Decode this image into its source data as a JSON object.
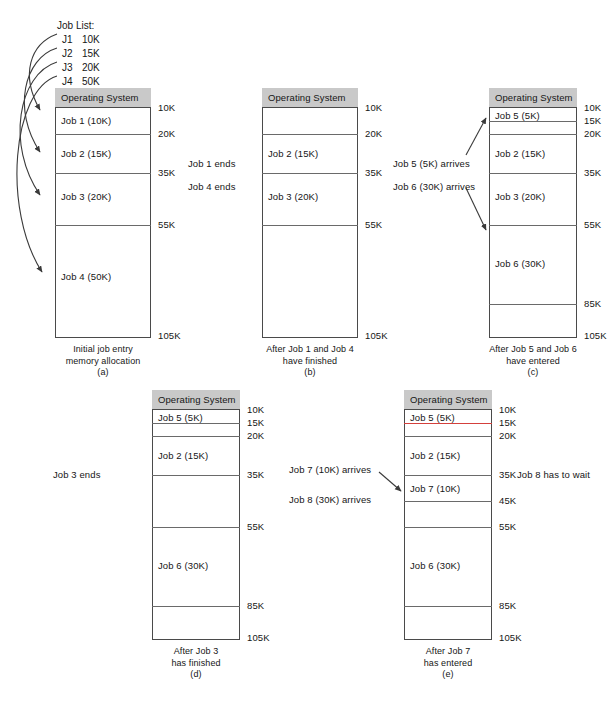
{
  "job_list": {
    "title": "Job List:",
    "rows": [
      {
        "name": "J1",
        "size": "10K"
      },
      {
        "name": "J2",
        "size": "15K"
      },
      {
        "name": "J3",
        "size": "20K"
      },
      {
        "name": "J4",
        "size": "50K"
      }
    ]
  },
  "os_label": "Operating System",
  "columns": [
    {
      "id": "a",
      "caption": "Initial job entry\nmemory allocation\n(a)",
      "blocks": [
        {
          "label": "Job 1   (10K)",
          "from": "10K",
          "to": "20K"
        },
        {
          "label": "Job 2   (15K)",
          "from": "20K",
          "to": "35K"
        },
        {
          "label": "Job 3   (20K)",
          "from": "35K",
          "to": "55K"
        },
        {
          "label": "Job 4   (50K)",
          "from": "55K",
          "to": "105K"
        }
      ],
      "addresses": [
        "10K",
        "20K",
        "35K",
        "55K",
        "105K"
      ]
    },
    {
      "id": "b",
      "caption": "After Job 1 and Job 4\nhave finished\n(b)",
      "blocks": [
        {
          "label": "",
          "from": "10K",
          "to": "20K"
        },
        {
          "label": "Job 2   (15K)",
          "from": "20K",
          "to": "35K"
        },
        {
          "label": "Job 3   (20K)",
          "from": "35K",
          "to": "55K"
        },
        {
          "label": "",
          "from": "55K",
          "to": "105K"
        }
      ],
      "addresses": [
        "10K",
        "20K",
        "35K",
        "55K",
        "105K"
      ]
    },
    {
      "id": "c",
      "caption": "After Job 5 and Job 6\nhave entered\n(c)",
      "blocks": [
        {
          "label": "Job 5   (5K)",
          "from": "10K",
          "to": "15K"
        },
        {
          "label": "",
          "from": "15K",
          "to": "20K"
        },
        {
          "label": "Job 2   (15K)",
          "from": "20K",
          "to": "35K"
        },
        {
          "label": "Job 3   (20K)",
          "from": "35K",
          "to": "55K"
        },
        {
          "label": "Job 6   (30K)",
          "from": "55K",
          "to": "85K"
        },
        {
          "label": "",
          "from": "85K",
          "to": "105K"
        }
      ],
      "addresses": [
        "10K",
        "15K",
        "20K",
        "35K",
        "55K",
        "85K",
        "105K"
      ]
    },
    {
      "id": "d",
      "caption": "After Job 3\nhas finished\n(d)",
      "blocks": [
        {
          "label": "Job 5   (5K)",
          "from": "10K",
          "to": "15K"
        },
        {
          "label": "",
          "from": "15K",
          "to": "20K"
        },
        {
          "label": "Job 2   (15K)",
          "from": "20K",
          "to": "35K"
        },
        {
          "label": "",
          "from": "35K",
          "to": "55K"
        },
        {
          "label": "Job 6   (30K)",
          "from": "55K",
          "to": "85K"
        },
        {
          "label": "",
          "from": "85K",
          "to": "105K"
        }
      ],
      "addresses": [
        "10K",
        "15K",
        "20K",
        "35K",
        "55K",
        "85K",
        "105K"
      ]
    },
    {
      "id": "e",
      "caption": "After Job 7\nhas entered\n(e)",
      "blocks": [
        {
          "label": "Job 5   (5K)",
          "from": "10K",
          "to": "15K"
        },
        {
          "label": "",
          "from": "15K",
          "to": "20K"
        },
        {
          "label": "Job 2   (15K)",
          "from": "20K",
          "to": "35K"
        },
        {
          "label": "Job 7   (10K)",
          "from": "35K",
          "to": "45K"
        },
        {
          "label": "",
          "from": "45K",
          "to": "55K"
        },
        {
          "label": "Job 6   (30K)",
          "from": "55K",
          "to": "85K"
        },
        {
          "label": "",
          "from": "85K",
          "to": "105K"
        }
      ],
      "addresses": [
        "10K",
        "15K",
        "20K",
        "35K",
        "45K",
        "55K",
        "85K",
        "105K"
      ]
    }
  ],
  "notes": {
    "job1_ends": "Job 1 ends",
    "job4_ends": "Job 4 ends",
    "job5_arrives": "Job 5 (5K) arrives",
    "job6_arrives": "Job 6 (30K) arrives",
    "job3_ends": "Job 3 ends",
    "job7_arrives": "Job 7 (10K) arrives",
    "job8_arrives": "Job 8 (30K) arrives",
    "job8_waits": "Job 8 has to wait"
  },
  "accent_red": "#d4403c",
  "os_bar_color": "#c9c9c9"
}
